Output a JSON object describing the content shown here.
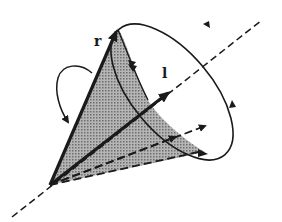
{
  "diagram": {
    "title": "",
    "labels": {
      "r": "r",
      "l": "l"
    },
    "colors": {
      "ink": "#1a1a1a",
      "cone_fill": "#9a9a9a",
      "background": "#ffffff"
    },
    "elements": [
      {
        "id": "axis",
        "type": "dashed-line",
        "meaning": "rotation axis"
      },
      {
        "id": "vector-r",
        "type": "bold-arrow",
        "label": "r"
      },
      {
        "id": "vector-l",
        "type": "bold-arrow",
        "label": "l"
      },
      {
        "id": "cone-base",
        "type": "ellipse-with-arrows"
      },
      {
        "id": "rotation-loop",
        "type": "curved-arrow"
      },
      {
        "id": "generators",
        "type": "dashed-arrows",
        "count": 2
      }
    ]
  }
}
